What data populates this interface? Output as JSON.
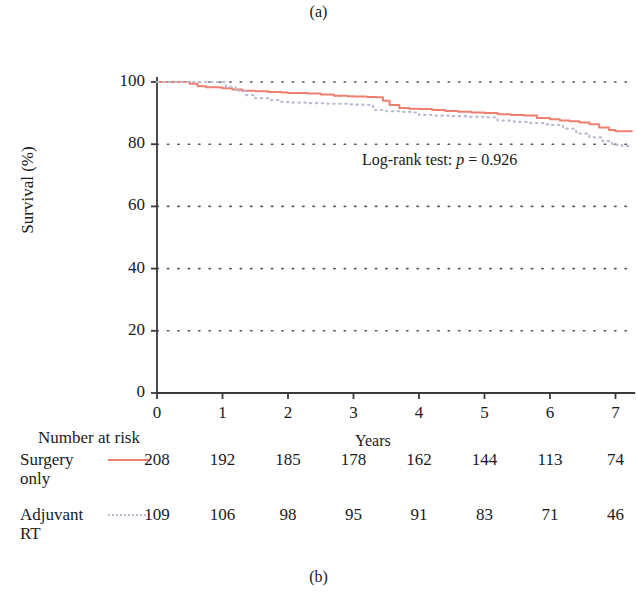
{
  "captions": {
    "top": "(a)",
    "bottom": "(b)"
  },
  "chart_data": {
    "type": "line",
    "title": "",
    "xlabel": "Years",
    "ylabel": "Survival (%)",
    "xlim": [
      0,
      7.3
    ],
    "ylim": [
      0,
      100
    ],
    "xticks": [
      0,
      1,
      2,
      3,
      4,
      5,
      6,
      7
    ],
    "yticks": [
      0,
      20,
      40,
      60,
      80,
      100
    ],
    "grid": "horizontal-dotted",
    "legend_position": "risk-table",
    "annotation": {
      "prefix": "Log-rank test: ",
      "italic": "p",
      "suffix": " = 0.926",
      "p_value": "0.926",
      "test": "Log-rank test"
    },
    "colors": {
      "surgery_only": "#ef8070",
      "adjuvant_rt": "#b9bdd0",
      "grid": "#555566",
      "axis": "#3a3a3a"
    },
    "series": [
      {
        "name": "Surgery only",
        "style": "solid",
        "color": "#ef8070",
        "points": [
          [
            0.0,
            100
          ],
          [
            0.45,
            100
          ],
          [
            0.5,
            99.4
          ],
          [
            0.62,
            98.6
          ],
          [
            0.75,
            98.3
          ],
          [
            0.95,
            98.2
          ],
          [
            1.0,
            98.0
          ],
          [
            1.15,
            97.6
          ],
          [
            1.3,
            97.2
          ],
          [
            1.5,
            97.0
          ],
          [
            1.7,
            96.8
          ],
          [
            1.9,
            96.6
          ],
          [
            2.0,
            96.5
          ],
          [
            2.3,
            96.3
          ],
          [
            2.5,
            96.0
          ],
          [
            2.7,
            95.6
          ],
          [
            2.9,
            95.4
          ],
          [
            3.0,
            95.3
          ],
          [
            3.2,
            95.2
          ],
          [
            3.35,
            95.1
          ],
          [
            3.45,
            94.0
          ],
          [
            3.55,
            92.6
          ],
          [
            3.7,
            91.6
          ],
          [
            3.85,
            91.4
          ],
          [
            4.0,
            91.3
          ],
          [
            4.2,
            91.0
          ],
          [
            4.4,
            90.7
          ],
          [
            4.6,
            90.4
          ],
          [
            4.8,
            90.2
          ],
          [
            5.0,
            90.0
          ],
          [
            5.2,
            89.6
          ],
          [
            5.4,
            89.4
          ],
          [
            5.6,
            89.2
          ],
          [
            5.8,
            88.4
          ],
          [
            6.0,
            88.0
          ],
          [
            6.15,
            87.6
          ],
          [
            6.3,
            87.4
          ],
          [
            6.45,
            87.0
          ],
          [
            6.6,
            86.4
          ],
          [
            6.75,
            85.4
          ],
          [
            6.9,
            84.6
          ],
          [
            7.0,
            84.2
          ],
          [
            7.25,
            84.2
          ]
        ]
      },
      {
        "name": "Adjuvant RT",
        "style": "dotted",
        "color": "#b9bdd0",
        "points": [
          [
            0.0,
            100
          ],
          [
            1.0,
            100
          ],
          [
            1.05,
            98.4
          ],
          [
            1.2,
            97.2
          ],
          [
            1.35,
            95.8
          ],
          [
            1.5,
            94.8
          ],
          [
            1.7,
            94.2
          ],
          [
            1.9,
            93.6
          ],
          [
            2.0,
            93.4
          ],
          [
            2.3,
            93.2
          ],
          [
            2.6,
            93.0
          ],
          [
            2.9,
            92.8
          ],
          [
            3.0,
            92.7
          ],
          [
            3.15,
            92.6
          ],
          [
            3.3,
            91.0
          ],
          [
            3.5,
            90.6
          ],
          [
            3.7,
            90.4
          ],
          [
            3.9,
            90.2
          ],
          [
            4.0,
            89.4
          ],
          [
            4.25,
            89.2
          ],
          [
            4.5,
            89.0
          ],
          [
            4.75,
            88.8
          ],
          [
            5.0,
            88.6
          ],
          [
            5.2,
            87.6
          ],
          [
            5.45,
            87.2
          ],
          [
            5.7,
            86.8
          ],
          [
            5.9,
            86.4
          ],
          [
            6.0,
            86.2
          ],
          [
            6.2,
            85.0
          ],
          [
            6.4,
            83.4
          ],
          [
            6.6,
            82.2
          ],
          [
            6.8,
            81.0
          ],
          [
            6.95,
            79.8
          ],
          [
            7.1,
            79.4
          ],
          [
            7.25,
            79.4
          ]
        ]
      }
    ]
  },
  "risk_table": {
    "title": "Number at risk",
    "times": [
      0,
      1,
      2,
      3,
      4,
      5,
      6,
      7
    ],
    "rows": [
      {
        "label_line1": "Surgery",
        "label_line2": "only",
        "style": "solid",
        "values": [
          208,
          192,
          185,
          178,
          162,
          144,
          113,
          74
        ]
      },
      {
        "label_line1": "Adjuvant",
        "label_line2": "RT",
        "style": "dotted",
        "values": [
          109,
          106,
          98,
          95,
          91,
          83,
          71,
          46
        ]
      }
    ]
  }
}
